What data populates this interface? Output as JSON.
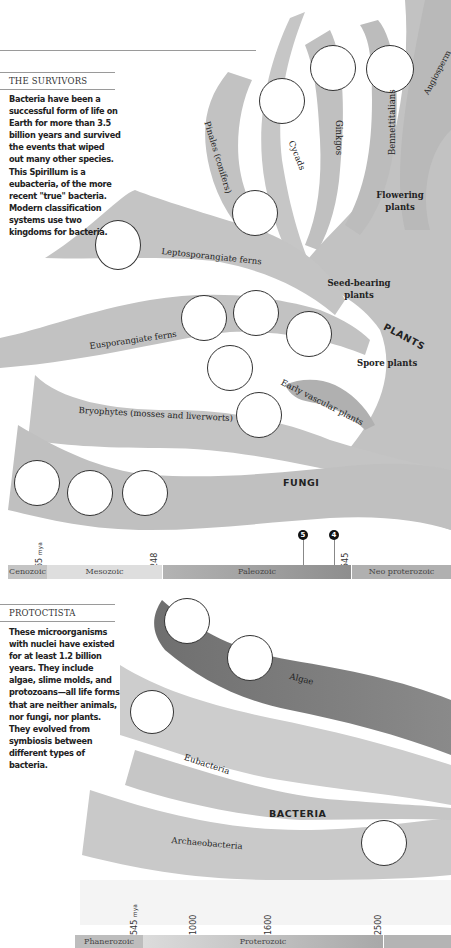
{
  "survivors": {
    "title": "THE SURVIVORS",
    "body": "Bacteria have been a successful form of life on Earth for more than 3.5 billion years and survived the events that wiped out many other species. This Spirillum is a eubacteria, of the more recent \"true\" bacteria. Modern classification systems use two kingdoms for bacteria."
  },
  "plants": {
    "kingdom_label": "PLANTS",
    "groups": {
      "flowering": "Flowering plants",
      "seed_bearing": "Seed-bearing plants",
      "spore": "Spore plants"
    },
    "branches": {
      "pinales": "Pinales (conifers)",
      "cycads": "Cycads",
      "ginkgos": "Ginkgos",
      "bennettitalians": "Bennettitalians",
      "angiosperms": "Angiosperm",
      "leptosporangiate": "Leptosporangiate ferns",
      "eusporangiate": "Eusporangiate ferns",
      "early_vascular": "Early vascular plants",
      "bryophytes": "Bryophytes (mosses and liverworts)"
    }
  },
  "fungi": {
    "label": "FUNGI"
  },
  "timeline1": {
    "ticks": [
      {
        "value": "65",
        "unit": "mya"
      },
      {
        "value": "248"
      },
      {
        "value": "545"
      }
    ],
    "markers": [
      "5",
      "4"
    ],
    "eras": [
      "Cenozoic",
      "Mesozoic",
      "Paleozoic",
      "Neo proterozoic"
    ]
  },
  "protoctista": {
    "title": "PROTOCTISTA",
    "body": "These microorganisms with nuclei have existed for at least 1.2 billion years. They include algae, slime molds, and protozoans—all life forms that are neither animals, nor fungi, nor plants. They evolved from symbiosis between different types of bacteria.",
    "branches": {
      "algae": "Algae"
    }
  },
  "bacteria": {
    "kingdom_label": "BACTERIA",
    "branches": {
      "eubacteria": "Eubacteria",
      "archaeobacteria": "Archaeobacteria"
    }
  },
  "timeline2": {
    "ticks": [
      {
        "value": "545",
        "unit": "mya"
      },
      {
        "value": "1000"
      },
      {
        "value": "1600"
      },
      {
        "value": "2500"
      }
    ],
    "eras": [
      "Phanerozoic",
      "Proterozoic"
    ]
  },
  "colors": {
    "branch_light": "#c9c9c9",
    "branch_mid": "#b3b3b3",
    "branch_dark": "#8a8a8a",
    "algae": "#7b7b7b"
  }
}
